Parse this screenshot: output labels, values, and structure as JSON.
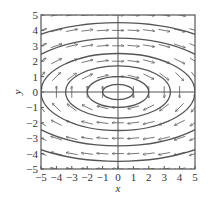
{
  "chart_data": {
    "type": "vector_field",
    "title": "",
    "xlabel": "x",
    "ylabel": "y",
    "xlim": [
      -5,
      5
    ],
    "ylim": [
      -5,
      5
    ],
    "xticks": [
      -5,
      -4,
      -3,
      -2,
      -1,
      0,
      1,
      2,
      3,
      4,
      5
    ],
    "yticks": [
      -5,
      -4,
      -3,
      -2,
      -1,
      0,
      1,
      2,
      3,
      4,
      5
    ],
    "grid": false,
    "field_direction": "clockwise rotation about origin (right on top, left on bottom)",
    "field": {
      "dx": "y",
      "dy": "-x/4"
    },
    "orbits": {
      "shape": "ellipse centered at origin",
      "semi_axes": [
        [
          1,
          0.5
        ],
        [
          2,
          1
        ],
        [
          3.4,
          1.7
        ],
        [
          5,
          2.5
        ],
        [
          7,
          3.5
        ],
        [
          9,
          4.5
        ]
      ]
    },
    "arrow_grid_spacing": 1
  },
  "colors": {
    "axis": "#555555",
    "curve": "#555555",
    "arrow": "#555555",
    "text": "#333333"
  }
}
